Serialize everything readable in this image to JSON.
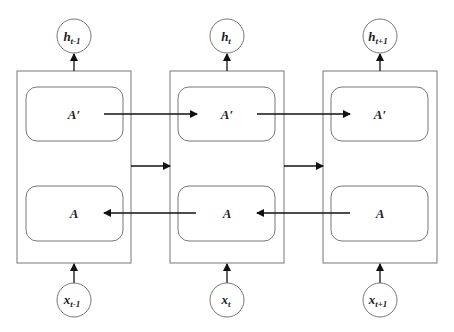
{
  "diagram": {
    "type": "bidirectional-rnn",
    "cells": [
      {
        "forward_label": "A′",
        "backward_label": "A",
        "output_label": "h",
        "output_sub": "t-1",
        "input_label": "x",
        "input_sub": "t-1"
      },
      {
        "forward_label": "A′",
        "backward_label": "A",
        "output_label": "h",
        "output_sub": "t",
        "input_label": "x",
        "input_sub": "t"
      },
      {
        "forward_label": "A′",
        "backward_label": "A",
        "output_label": "h",
        "output_sub": "t+1",
        "input_label": "x",
        "input_sub": "t+1"
      }
    ],
    "colors": {
      "stroke": "#777777",
      "arrow": "#111111",
      "background": "#ffffff"
    }
  }
}
